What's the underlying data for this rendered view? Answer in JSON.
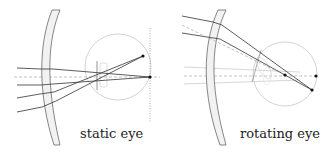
{
  "panels": [
    {
      "id": "static",
      "caption": "static eye"
    },
    {
      "id": "rotating",
      "caption": "rotating eye"
    }
  ],
  "colors": {
    "ray": "#333333",
    "lens_fill": "#f2f2f2",
    "lens_stroke": "#555555",
    "eyeball": "#c8c8c8",
    "axis_dashed": "#999999",
    "point": "#111111"
  }
}
